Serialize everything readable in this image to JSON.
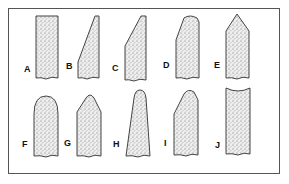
{
  "figure": {
    "items": [
      {
        "label": "A",
        "shape": "flat-top-rectangle"
      },
      {
        "label": "B",
        "shape": "steep-slant-tip"
      },
      {
        "label": "C",
        "shape": "slant-tip-with-shoulder"
      },
      {
        "label": "D",
        "shape": "rounded-slant-tip"
      },
      {
        "label": "E",
        "shape": "pointed-tip"
      },
      {
        "label": "F",
        "shape": "rounded-dome-top"
      },
      {
        "label": "G",
        "shape": "rounded-cone-top"
      },
      {
        "label": "H",
        "shape": "tapered-rounded-top"
      },
      {
        "label": "I",
        "shape": "rounded-one-side-slant"
      },
      {
        "label": "J",
        "shape": "concave-top"
      }
    ]
  },
  "colors": {
    "stroke": "#444444",
    "fill": "#e6e6e6",
    "stipple": "#666666",
    "frame": "#555555"
  }
}
